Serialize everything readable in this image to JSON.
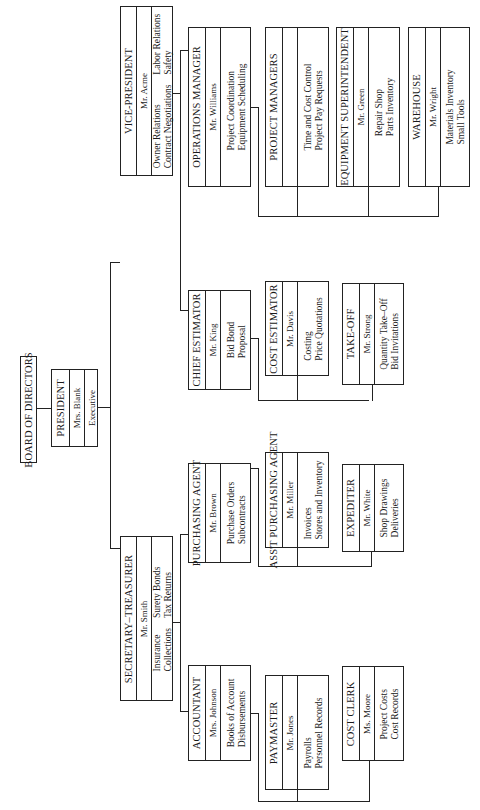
{
  "chart_orientation": "rotated 90 degrees counter-clockwise",
  "board": {
    "title": "BOARD OF DIRECTORS"
  },
  "president": {
    "title": "PRESIDENT",
    "name": "Mrs. Blank",
    "duties": [
      "Executive"
    ]
  },
  "vice_president": {
    "title": "VICE-PRESIDENT",
    "name": "Mr. Acme",
    "duties_left": [
      "Owner Relations",
      "Contract Negotiations"
    ],
    "duties_right": [
      "Labor Relations",
      "Safety"
    ]
  },
  "secretary_treasurer": {
    "title": "SECRETARY–TREASURER",
    "name": "Mr. Smith",
    "duties_left": [
      "Insurance",
      "Collections"
    ],
    "duties_right": [
      "Surety Bonds",
      "Tax Returns"
    ]
  },
  "operations_manager": {
    "title": "OPERATIONS MANAGER",
    "name": "Mr. Williams",
    "duties": [
      "Project Coordination",
      "Equipment Scheduling"
    ]
  },
  "project_managers": {
    "title": "PROJECT MANAGERS",
    "name": "",
    "duties": [
      "Time and Cost Control",
      "Project Pay Requests"
    ]
  },
  "equipment_superintendent": {
    "title": "EQUIPMENT SUPERINTENDENT",
    "name": "Mr. Green",
    "duties": [
      "Repair Shop",
      "Parts Inventory"
    ]
  },
  "warehouse": {
    "title": "WAREHOUSE",
    "name": "Mr. Wright",
    "duties": [
      "Materials Inventory",
      "Small Tools"
    ]
  },
  "chief_estimator": {
    "title": "CHIEF ESTIMATOR",
    "name": "Mr. King",
    "duties": [
      "Bid Bond",
      "Proposal"
    ]
  },
  "cost_estimator": {
    "title": "COST ESTIMATOR",
    "name": "Mr. Davis",
    "duties": [
      "Costing",
      "Price Quotations"
    ]
  },
  "take_off": {
    "title": "TAKE-OFF",
    "name": "Mr. Strong",
    "duties": [
      "Quantity Take–Off",
      "Bid Invitations"
    ]
  },
  "purchasing_agent": {
    "title": "PURCHASING AGENT",
    "name": "Mr. Brown",
    "duties": [
      "Purchase Orders",
      "Subcontracts"
    ]
  },
  "asst_purchasing_agent": {
    "title": "ASS'T PURCHASING AGENT",
    "name": "Mr. Miller",
    "duties": [
      "Invoices",
      "Stores and Inventory"
    ]
  },
  "expediter": {
    "title": "EXPEDITER",
    "name": "Mr. White",
    "duties": [
      "Shop Drawings",
      "Deliveries"
    ]
  },
  "accountant": {
    "title": "ACCOUNTANT",
    "name": "Mrs. Johnson",
    "duties": [
      "Books of Account",
      "Disbursements"
    ]
  },
  "paymaster": {
    "title": "PAYMASTER",
    "name": "Mr. Jones",
    "duties": [
      "Payrolls",
      "Personnel Records"
    ]
  },
  "cost_clerk": {
    "title": "COST CLERK",
    "name": "Ms. Moore",
    "duties": [
      "Project Costs",
      "Cost Records"
    ]
  }
}
